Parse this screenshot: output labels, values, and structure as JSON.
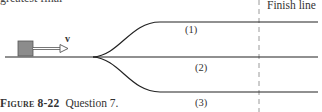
{
  "top_text": "greatest final",
  "figure": {
    "finish_label": "Finish line",
    "velocity_label": "v",
    "tracks": [
      {
        "id": 1,
        "label": "(1)",
        "shape": "rises then level (upper path)"
      },
      {
        "id": 2,
        "label": "(2)",
        "shape": "flat (straight path)"
      },
      {
        "id": 3,
        "label": "(3)",
        "shape": "dips then level (lower path)"
      }
    ],
    "block": {
      "color": "#8c8c8c",
      "border": "#555555"
    },
    "line_color": "#222222",
    "finish_line_color": "#999999"
  },
  "caption": {
    "figure_number": "Figure 8-22",
    "text": "Question 7."
  }
}
